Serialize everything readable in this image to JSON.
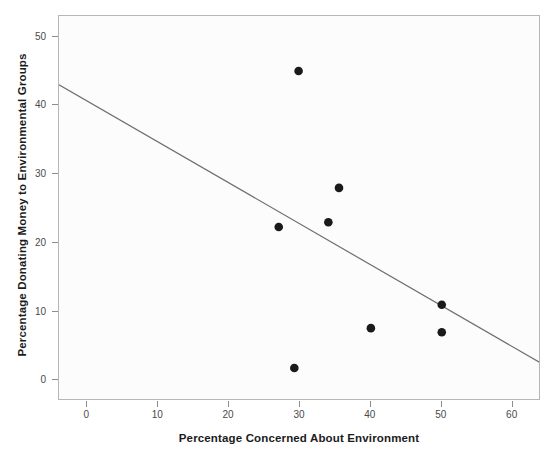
{
  "chart_data": {
    "type": "scatter",
    "title": "",
    "xlabel": "Percentage Concerned About Environment",
    "ylabel": "Percentage Donating Money to Environmental Groups",
    "xlim": [
      -4,
      64
    ],
    "ylim": [
      -3,
      53
    ],
    "xticks": [
      0,
      10,
      20,
      30,
      40,
      50,
      60
    ],
    "yticks": [
      0,
      10,
      20,
      30,
      40,
      50
    ],
    "grid": false,
    "legend": null,
    "marker_color": "#1a1a1a",
    "line_color": "#6e6e6e",
    "points": [
      {
        "x": 29.8,
        "y": 45.0
      },
      {
        "x": 27.0,
        "y": 22.3
      },
      {
        "x": 35.5,
        "y": 28.0
      },
      {
        "x": 34.0,
        "y": 23.0
      },
      {
        "x": 29.2,
        "y": 1.8
      },
      {
        "x": 40.0,
        "y": 7.6
      },
      {
        "x": 50.0,
        "y": 11.0
      },
      {
        "x": 50.0,
        "y": 7.0
      }
    ],
    "fit_line": {
      "x_start": -4,
      "y_start": 43.0,
      "x_end": 64,
      "y_end": 2.5
    }
  },
  "axis": {
    "x_tick_labels": [
      "0",
      "10",
      "20",
      "30",
      "40",
      "50",
      "60"
    ],
    "y_tick_labels": [
      "0",
      "10",
      "20",
      "30",
      "40",
      "50"
    ]
  }
}
